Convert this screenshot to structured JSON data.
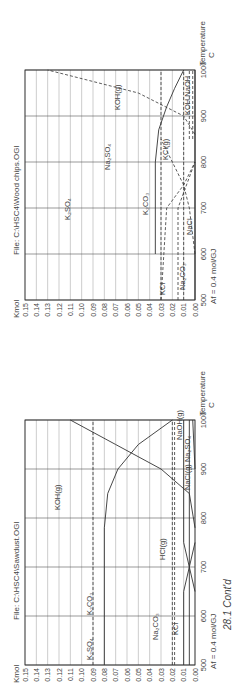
{
  "figure": {
    "caption": "28.1 Cont'd",
    "rotation": "90deg counter-clockwise"
  },
  "chart_data": [
    {
      "type": "line",
      "title": "File: C:\\HSC4\\Sawdust.OGI",
      "ylabel": "Kmol",
      "xlabel": "Temperature C",
      "x_note": "Af = 0.4 mol/GJ",
      "xlim": [
        500,
        1000
      ],
      "ylim": [
        0,
        0.15
      ],
      "x_ticks": [
        500,
        600,
        700,
        800,
        900,
        1000
      ],
      "y_ticks": [
        0.0,
        0.01,
        0.02,
        0.03,
        0.04,
        0.05,
        0.06,
        0.07,
        0.08,
        0.09,
        0.1,
        0.11,
        0.12,
        0.13,
        0.14,
        0.15
      ],
      "grid": true,
      "series": [
        {
          "name": "K2SO4",
          "style": "dashed",
          "x": [
            500,
            1000
          ],
          "y": [
            0.09,
            0.09
          ]
        },
        {
          "name": "K2CO3",
          "style": "solid",
          "x": [
            500,
            700,
            780,
            850,
            900,
            950,
            1000
          ],
          "y": [
            0.08,
            0.08,
            0.08,
            0.077,
            0.068,
            0.05,
            0.02
          ]
        },
        {
          "name": "KOH(g)",
          "style": "solid",
          "x": [
            780,
            850,
            900,
            950,
            1000
          ],
          "y": [
            0.0,
            0.005,
            0.03,
            0.07,
            0.11
          ]
        },
        {
          "name": "Na2CO3",
          "style": "dashed",
          "x": [
            500,
            1000
          ],
          "y": [
            0.02,
            0.02
          ]
        },
        {
          "name": "HCl(g)",
          "style": "dashed",
          "x": [
            500,
            1000
          ],
          "y": [
            0.018,
            0.018
          ]
        },
        {
          "name": "KCl",
          "style": "solid",
          "x": [
            500,
            650,
            700,
            750
          ],
          "y": [
            0.01,
            0.01,
            0.005,
            0.0
          ]
        },
        {
          "name": "NaCl(g)",
          "style": "solid",
          "x": [
            650,
            700,
            750,
            1000
          ],
          "y": [
            0.0,
            0.005,
            0.01,
            0.01
          ]
        },
        {
          "name": "Na2SO4",
          "style": "solid",
          "x": [
            500,
            1000
          ],
          "y": [
            0.005,
            0.005
          ]
        },
        {
          "name": "NaOH(g)",
          "style": "solid",
          "x": [
            900,
            1000
          ],
          "y": [
            0.0,
            0.002
          ]
        }
      ],
      "annotations": [
        "K2SO4",
        "K2CO3",
        "KOH(g)",
        "Na2CO3",
        "HCl(g)",
        "KCl",
        "NaCl(g)",
        "Na2SO4",
        "NaOH(g)"
      ]
    },
    {
      "type": "line",
      "title": "File: C:\\HSC4\\Wood chips.OGI",
      "ylabel": "Kmol",
      "xlabel": "Temperature C",
      "x_note": "Af = 0.4 mol/GJ",
      "xlim": [
        500,
        1000
      ],
      "ylim": [
        0,
        0.15
      ],
      "x_ticks": [
        500,
        600,
        700,
        800,
        900,
        1000
      ],
      "y_ticks": [
        0.0,
        0.01,
        0.02,
        0.03,
        0.04,
        0.05,
        0.06,
        0.07,
        0.08,
        0.09,
        0.1,
        0.11,
        0.12,
        0.13,
        0.14,
        0.15
      ],
      "grid": true,
      "series": [
        {
          "name": "K2SO4",
          "style": "solid",
          "x": [
            500,
            1000
          ],
          "y": [
            0.0,
            0.0
          ]
        },
        {
          "name": "K2CO3",
          "style": "solid",
          "x": [
            600,
            700,
            800,
            870,
            920,
            960,
            1000
          ],
          "y": [
            0.035,
            0.035,
            0.035,
            0.032,
            0.025,
            0.018,
            0.01
          ]
        },
        {
          "name": "KOH(g)",
          "style": "dashed",
          "x": [
            860,
            900,
            950,
            1000
          ],
          "y": [
            0.0,
            0.01,
            0.05,
            0.13
          ]
        },
        {
          "name": "Na2SO4",
          "style": "dashed",
          "x": [
            500,
            1000
          ],
          "y": [
            0.03,
            0.03
          ]
        },
        {
          "name": "KCl(g)",
          "style": "dashed",
          "x": [
            600,
            700,
            750,
            800,
            850
          ],
          "y": [
            0.0,
            0.005,
            0.01,
            0.02,
            0.03
          ]
        },
        {
          "name": "KCl",
          "style": "dashed",
          "x": [
            500,
            700,
            750,
            800
          ],
          "y": [
            0.03,
            0.025,
            0.01,
            0.0
          ]
        },
        {
          "name": "Na2CO3",
          "style": "dashed",
          "x": [
            500,
            700,
            800
          ],
          "y": [
            0.015,
            0.015,
            0.0
          ]
        },
        {
          "name": "NaCl",
          "style": "dashed",
          "x": [
            500,
            1000
          ],
          "y": [
            0.01,
            0.01
          ]
        },
        {
          "name": "KOH",
          "style": "dashed",
          "x": [
            850,
            1000
          ],
          "y": [
            0.005,
            0.005
          ]
        },
        {
          "name": "NaOH",
          "style": "dashed",
          "x": [
            850,
            1000
          ],
          "y": [
            0.002,
            0.002
          ]
        }
      ],
      "annotations": [
        "K2SO4",
        "K2CO3",
        "KOH(g)",
        "Na2SO4",
        "KCl(g)",
        "KCl",
        "Na2CO3",
        "NaCl",
        "KOH",
        "NaOH"
      ]
    }
  ],
  "labels": {
    "sawdust_title": "File: C:\\HSC4\\Sawdust.OGI",
    "wood_title": "File: C:\\HSC4\\Wood chips.OGI",
    "kmol": "Kmol",
    "temperature": "Temperature",
    "unit_c": "C",
    "af_note": "Af = 0.4 mol/GJ"
  }
}
